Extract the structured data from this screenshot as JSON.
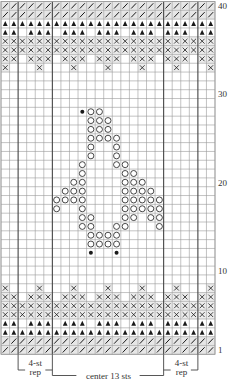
{
  "chart_data": {
    "type": "knitting-chart",
    "columns": 25,
    "rows": 40,
    "legend_symbols": {
      "/": "slash",
      "T": "filled-triangle",
      "X": "boxed-x",
      "O": "open-circle",
      "*": "filled-dot",
      ".": "blank"
    },
    "grid_rows_top_to_bottom": [
      {
        "row": 40,
        "cells": "/////////////////////////"
      },
      {
        "row": 39,
        "cells": "/////////////////////////"
      },
      {
        "row": 38,
        "cells": "TTTTTTTTTTTTTTTTTTTTTTTTT"
      },
      {
        "row": 37,
        "cells": "TT.TTT.TTT.TTT.TTT.TTT.TT"
      },
      {
        "row": 36,
        "cells": "XXXXXXXXXXXXXXXXXXXXXXXXX"
      },
      {
        "row": 35,
        "cells": "XXXXXXXXXXXXXXXXXXXXXXXXX"
      },
      {
        "row": 34,
        "cells": "XX.XXX.XXX.XXX.XXX.XXX.XX"
      },
      {
        "row": 33,
        "cells": "X...X...X...X...X...X...X"
      },
      {
        "row": 32,
        "cells": "........................."
      },
      {
        "row": 31,
        "cells": "........................."
      },
      {
        "row": 30,
        "cells": "........................."
      },
      {
        "row": 29,
        "cells": "........................."
      },
      {
        "row": 28,
        "cells": ".........*OO............."
      },
      {
        "row": 27,
        "cells": "..........OOO............"
      },
      {
        "row": 26,
        "cells": "..........OOO............"
      },
      {
        "row": 25,
        "cells": "..........OOOO..........."
      },
      {
        "row": 24,
        "cells": "..........O..O..........."
      },
      {
        "row": 23,
        "cells": "..........O..O..........."
      },
      {
        "row": 22,
        "cells": ".........O...OO.........."
      },
      {
        "row": 21,
        "cells": ".........O....OO........."
      },
      {
        "row": 20,
        "cells": "........OO....OOO........"
      },
      {
        "row": 19,
        "cells": ".......OOO....OOOO......."
      },
      {
        "row": 18,
        "cells": "......OOOO....OOOOO......"
      },
      {
        "row": 17,
        "cells": "......O..O....OOOOO......"
      },
      {
        "row": 16,
        "cells": ".........OO...OO.OO......"
      },
      {
        "row": 15,
        "cells": ".........OO..OO...O......"
      },
      {
        "row": 14,
        "cells": "..........OOOO..........."
      },
      {
        "row": 13,
        "cells": "..........OOOO..........."
      },
      {
        "row": 12,
        "cells": "..........*..*..........."
      },
      {
        "row": 11,
        "cells": "........................."
      },
      {
        "row": 10,
        "cells": "........................."
      },
      {
        "row": 9,
        "cells": "........................."
      },
      {
        "row": 8,
        "cells": "X...X...X...X...X...X...X"
      },
      {
        "row": 7,
        "cells": "XX.XXX.XXX.XXX.XXX.XXX.XX"
      },
      {
        "row": 6,
        "cells": "XXXXXXXXXXXXXXXXXXXXXXXXX"
      },
      {
        "row": 5,
        "cells": "XXXXXXXXXXXXXXXXXXXXXXXXX"
      },
      {
        "row": 4,
        "cells": "TT.TTT.TTT.TTT.TTT.TTT.TT"
      },
      {
        "row": 3,
        "cells": "TTTTTTTTTTTTTTTTTTTTTTTTT"
      },
      {
        "row": 2,
        "cells": "/////////////////////////"
      },
      {
        "row": 1,
        "cells": "/////////////////////////"
      }
    ],
    "row_number_labels": [
      {
        "row": 40,
        "text": "40"
      },
      {
        "row": 30,
        "text": "30"
      },
      {
        "row": 20,
        "text": "20"
      },
      {
        "row": 10,
        "text": "10"
      },
      {
        "row": 1,
        "text": "1"
      }
    ],
    "heavy_column_lines": [
      2,
      6,
      19,
      23
    ],
    "brackets": [
      {
        "name": "left-rep",
        "from_col": 2,
        "to_col": 6,
        "line1": "4-st",
        "line2": "rep"
      },
      {
        "name": "center",
        "from_col": 6,
        "to_col": 19,
        "line1": "center 13 sts"
      },
      {
        "name": "right-rep",
        "from_col": 19,
        "to_col": 23,
        "line1": "4-st",
        "line2": "rep"
      }
    ]
  },
  "labels": {
    "left_rep_line1": "4-st",
    "left_rep_line2": "rep",
    "center": "center 13 sts",
    "right_rep_line1": "4-st",
    "right_rep_line2": "rep"
  },
  "colors": {
    "grid_line": "#9a9a9a",
    "heavy_line": "#444444",
    "symbol": "#1a1a1a",
    "label": "#333333"
  }
}
